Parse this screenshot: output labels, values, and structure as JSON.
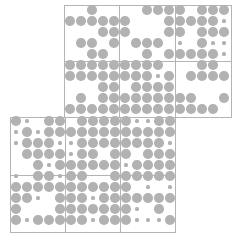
{
  "diagram": {
    "type": "dot-grid-puzzle",
    "dot_color": "#b2b2b2",
    "border_color": "#b4b4b4",
    "pitch": 11,
    "large_radius": 4.8,
    "small_radius": 1.6,
    "legend": {
      "L": "large dot",
      "s": "small dot",
      ".": "empty"
    },
    "sections": [
      {
        "name": "top-section",
        "box": {
          "x": 64,
          "y": 5,
          "w": 168,
          "h": 113
        },
        "vlines": [
          119,
          175
        ],
        "hlines": [
          61
        ],
        "origin": {
          "x": 70,
          "y": 10
        },
        "rows": [
          "..L....LLLL.LLL",
          "LLLLLL...LLLLLs",
          "...LLL...LL.LLL",
          ".LL.L.LLL.s.Lss",
          "..LL...L.LLLLLs",
          "LLLLLLLLL...LL.",
          "LLLLLLLLsL.LLLL",
          "...LL.LLLL.....",
          ".L.LLLLLLLLL..L",
          "LLLLLLLLLLLLLL."
        ]
      },
      {
        "name": "bottom-section",
        "box": {
          "x": 10,
          "y": 117,
          "w": 166,
          "h": 116
        },
        "vlines": [
          65,
          120
        ],
        "hlines": [
          175
        ],
        "origin": {
          "x": 16,
          "y": 121
        },
        "rows": [
          "Ls.LL.LLLLLssLL",
          "sLsLLLLLLLLLLLL",
          "sLLLssLLLLLLLLs",
          ".LLLLsLL.LL.LLL",
          "..LsLLLLLLsLLLL",
          "s.LLsLL..LLLLLL",
          "LLLLLLLLLLL.s.s",
          "LLs.LLLsLLLLLLL",
          "L...LLLLLLLs.L.",
          "LsLLLLLsLLLsssL"
        ]
      }
    ]
  }
}
